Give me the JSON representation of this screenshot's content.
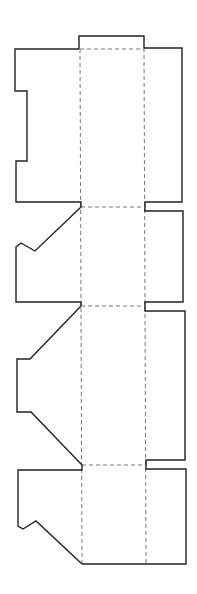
{
  "diagram": {
    "title": "Box dieline template",
    "width": 197,
    "height": 594,
    "colors": {
      "background": "#ffffff",
      "cut_line": "#222222",
      "fold_line": "#777777"
    },
    "cut_paths": [
      {
        "name": "top-tab",
        "d": "M79,49 L79,36 L144,36 L144,48"
      },
      {
        "name": "left-flap-1",
        "d": "M79,49 L15,49 L15,91 L27,91 L27,161 L16,161 L16,202 L81,202 L81,207"
      },
      {
        "name": "left-flap-2",
        "d": "M81,207 L35,251 L21,243 L16,247 L16,302 L81,302 L81,306"
      },
      {
        "name": "left-flap-3",
        "d": "M81,306 L30,359 L17,359 L17,412 L31,412 L82,465 L82,470 L18,470 L18,526 L23,529 L36,521 L82,564"
      },
      {
        "name": "bottom-edge",
        "d": "M82,564 L186,564 L186,469 L146,469 L146,465"
      },
      {
        "name": "right-flaps",
        "d": "M144,48 L182,48 L182,202 L145,202 L145,211 L183,211 L183,302 L145,302 L145,311 L185,311 L185,460 L146,460 L146,465"
      }
    ],
    "fold_lines": [
      {
        "name": "fold-vertical-left",
        "x1": 80,
        "y1": 49,
        "x2": 82,
        "y2": 564
      },
      {
        "name": "fold-vertical-right",
        "x1": 144,
        "y1": 48,
        "x2": 146,
        "y2": 564
      },
      {
        "name": "fold-horizontal-1",
        "x1": 80,
        "y1": 49,
        "x2": 144,
        "y2": 49
      },
      {
        "name": "fold-horizontal-2",
        "x1": 81,
        "y1": 207,
        "x2": 145,
        "y2": 207
      },
      {
        "name": "fold-horizontal-3",
        "x1": 81,
        "y1": 306,
        "x2": 145,
        "y2": 306
      },
      {
        "name": "fold-horizontal-4",
        "x1": 82,
        "y1": 465,
        "x2": 146,
        "y2": 465
      }
    ]
  }
}
